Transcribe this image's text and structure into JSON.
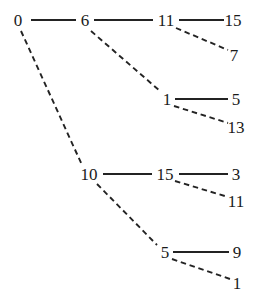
{
  "diagram": {
    "type": "binary-tree",
    "orientation": "left-to-right",
    "background_color": "#ffffff",
    "stroke_color": "#232323",
    "text_color": "#1a1a1a",
    "edge_styles": {
      "solid": "solid line denotes left / first child",
      "dashed": "dashed line denotes right / second child"
    },
    "width": 256,
    "height": 308
  },
  "chart_data": {
    "type": "diagram",
    "nodes": [
      {
        "id": "n0",
        "label": "0",
        "x": 18,
        "y": 20,
        "depth": 0
      },
      {
        "id": "n1",
        "label": "6",
        "x": 85,
        "y": 20,
        "depth": 1
      },
      {
        "id": "n2",
        "label": "11",
        "x": 166,
        "y": 20,
        "depth": 2
      },
      {
        "id": "n3",
        "label": "15",
        "x": 233,
        "y": 20,
        "depth": 3
      },
      {
        "id": "n4",
        "label": "7",
        "x": 234,
        "y": 55,
        "depth": 3
      },
      {
        "id": "n5",
        "label": "1",
        "x": 167,
        "y": 99,
        "depth": 2
      },
      {
        "id": "n6",
        "label": "5",
        "x": 236,
        "y": 99,
        "depth": 3
      },
      {
        "id": "n7",
        "label": "13",
        "x": 236,
        "y": 127,
        "depth": 3
      },
      {
        "id": "n8",
        "label": "10",
        "x": 89,
        "y": 174,
        "depth": 1
      },
      {
        "id": "n9",
        "label": "15",
        "x": 165,
        "y": 174,
        "depth": 2
      },
      {
        "id": "n10",
        "label": "3",
        "x": 236,
        "y": 174,
        "depth": 3
      },
      {
        "id": "n11",
        "label": "11",
        "x": 236,
        "y": 201,
        "depth": 3
      },
      {
        "id": "n12",
        "label": "5",
        "x": 165,
        "y": 252,
        "depth": 2
      },
      {
        "id": "n13",
        "label": "9",
        "x": 237,
        "y": 252,
        "depth": 3
      },
      {
        "id": "n14",
        "label": "1",
        "x": 237,
        "y": 283,
        "depth": 3
      }
    ],
    "edges": [
      {
        "id": "e0",
        "from": "n0",
        "to": "n1",
        "style": "solid",
        "x1": 31,
        "y1": 20,
        "x2": 76,
        "y2": 20
      },
      {
        "id": "e1",
        "from": "n0",
        "to": "n8",
        "style": "dashed",
        "x1": 21,
        "y1": 31,
        "x2": 82,
        "y2": 165
      },
      {
        "id": "e2",
        "from": "n1",
        "to": "n2",
        "style": "solid",
        "x1": 94,
        "y1": 20,
        "x2": 153,
        "y2": 20
      },
      {
        "id": "e3",
        "from": "n1",
        "to": "n5",
        "style": "dashed",
        "x1": 91,
        "y1": 31,
        "x2": 160,
        "y2": 91
      },
      {
        "id": "e4",
        "from": "n2",
        "to": "n3",
        "style": "solid",
        "x1": 179,
        "y1": 20,
        "x2": 224,
        "y2": 20
      },
      {
        "id": "e5",
        "from": "n2",
        "to": "n4",
        "style": "dashed",
        "x1": 176,
        "y1": 28,
        "x2": 228,
        "y2": 50
      },
      {
        "id": "e6",
        "from": "n5",
        "to": "n6",
        "style": "solid",
        "x1": 175,
        "y1": 99,
        "x2": 228,
        "y2": 99
      },
      {
        "id": "e7",
        "from": "n5",
        "to": "n7",
        "style": "dashed",
        "x1": 174,
        "y1": 106,
        "x2": 228,
        "y2": 123
      },
      {
        "id": "e8",
        "from": "n8",
        "to": "n9",
        "style": "solid",
        "x1": 103,
        "y1": 174,
        "x2": 152,
        "y2": 174
      },
      {
        "id": "e9",
        "from": "n8",
        "to": "n12",
        "style": "dashed",
        "x1": 97,
        "y1": 184,
        "x2": 157,
        "y2": 245
      },
      {
        "id": "e10",
        "from": "n9",
        "to": "n10",
        "style": "solid",
        "x1": 179,
        "y1": 174,
        "x2": 228,
        "y2": 174
      },
      {
        "id": "e11",
        "from": "n9",
        "to": "n11",
        "style": "dashed",
        "x1": 175,
        "y1": 181,
        "x2": 228,
        "y2": 197
      },
      {
        "id": "e12",
        "from": "n12",
        "to": "n13",
        "style": "solid",
        "x1": 173,
        "y1": 252,
        "x2": 229,
        "y2": 252
      },
      {
        "id": "e13",
        "from": "n12",
        "to": "n14",
        "style": "dashed",
        "x1": 172,
        "y1": 259,
        "x2": 230,
        "y2": 279
      }
    ]
  }
}
